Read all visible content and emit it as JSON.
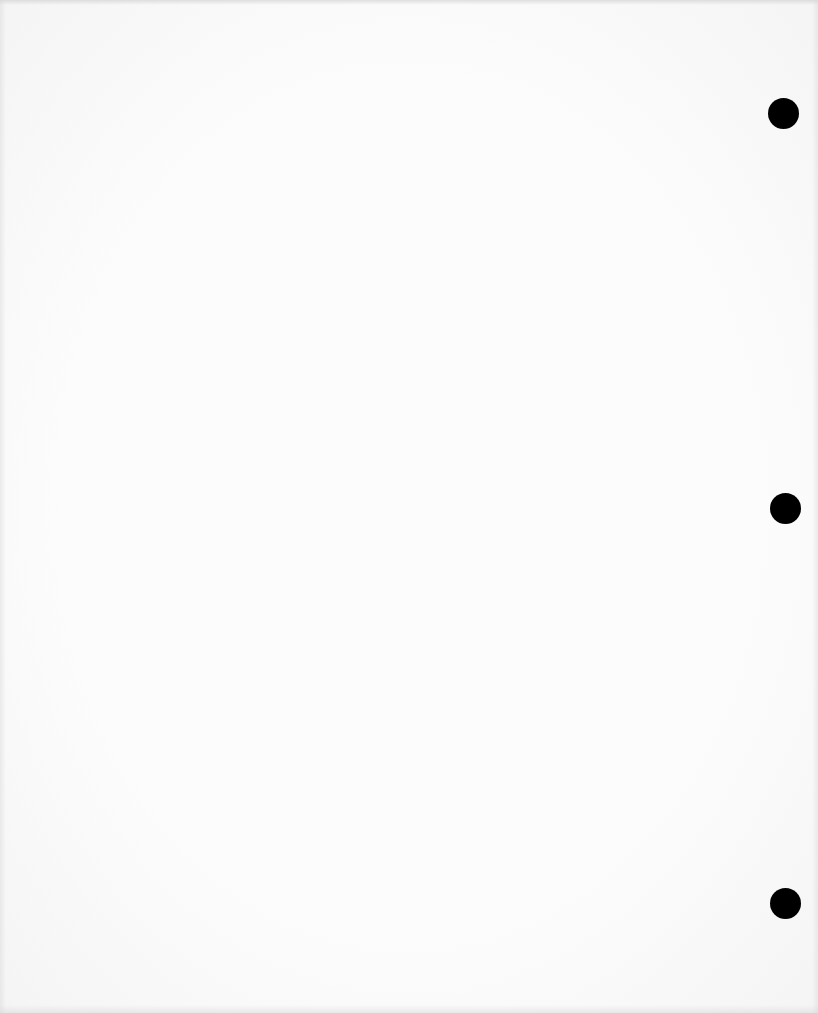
{
  "document": {
    "type": "blank-scanned-page",
    "background_color": "#fcfcfc",
    "text_content": ""
  },
  "punch_holes": [
    {
      "cx": 783,
      "cy": 113,
      "diameter": 31,
      "color": "#000000"
    },
    {
      "cx": 785,
      "cy": 508,
      "diameter": 31,
      "color": "#000000"
    },
    {
      "cx": 785,
      "cy": 903,
      "diameter": 31,
      "color": "#000000"
    }
  ]
}
